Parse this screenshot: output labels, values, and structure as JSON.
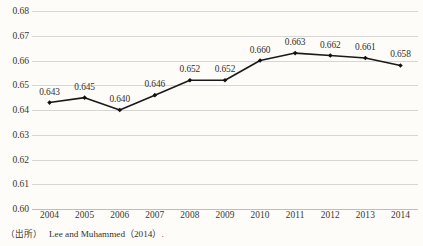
{
  "chart_data": {
    "type": "line",
    "title": "",
    "subtitle": "",
    "xlabel": "",
    "ylabel": "",
    "categories": [
      "2004",
      "2005",
      "2006",
      "2007",
      "2008",
      "2009",
      "2010",
      "2011",
      "2012",
      "2013",
      "2014"
    ],
    "values": [
      0.643,
      0.645,
      0.64,
      0.646,
      0.652,
      0.652,
      0.66,
      0.663,
      0.662,
      0.661,
      0.658
    ],
    "point_labels": [
      "0.643",
      "0.645",
      "0.640",
      "0.646",
      "0.652",
      "0.652",
      "0.660",
      "0.663",
      "0.662",
      "0.661",
      "0.658"
    ],
    "ylim": [
      0.6,
      0.68
    ],
    "y_ticks": [
      0.68,
      0.67,
      0.66,
      0.65,
      0.64,
      0.63,
      0.62,
      0.61,
      0.6
    ],
    "y_tick_labels": [
      "0.68",
      "0.67",
      "0.66",
      "0.65",
      "0.64",
      "0.63",
      "0.62",
      "0.61",
      "0.60"
    ],
    "grid": true,
    "legend": false,
    "legend_position": "none",
    "series": [
      {
        "name": "",
        "values": [
          0.643,
          0.645,
          0.64,
          0.646,
          0.652,
          0.652,
          0.66,
          0.663,
          0.662,
          0.661,
          0.658
        ]
      }
    ],
    "line_color": "#1a1a1a",
    "marker": "diamond",
    "marker_color": "#111111",
    "grid_color": "#d8d6d2",
    "background_color": "#fdfcf8"
  },
  "source": {
    "tag": "（出所）",
    "reference": "Lee and Muhammed（2014）."
  }
}
